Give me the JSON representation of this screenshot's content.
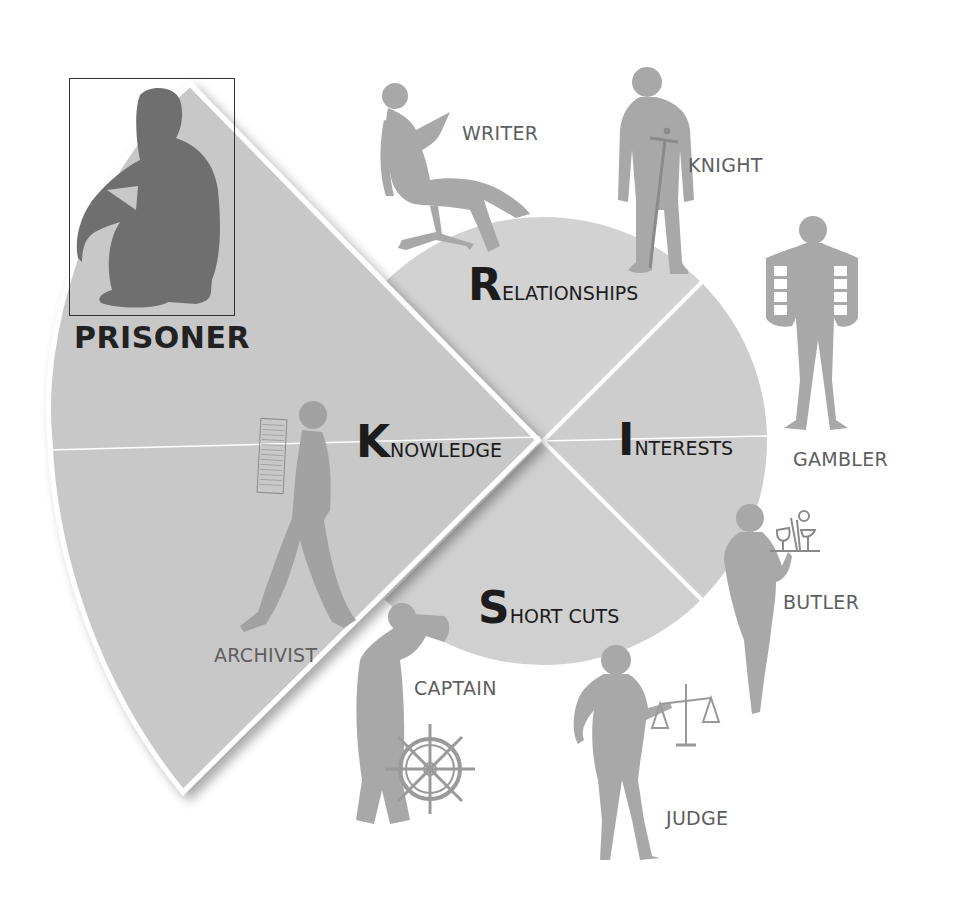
{
  "diagram": {
    "colors": {
      "segment_fill": "#cfcfcf",
      "wedge_fill": "#c9c9c9",
      "figure_fill": "#a9a9a9",
      "prisoner_fill": "#707070",
      "divider": "#ffffff",
      "label_text": "#5e5e5e",
      "segment_text": "#1c1c1c"
    },
    "segments": [
      {
        "id": "relationships",
        "initial": "R",
        "rest": "ELATIONSHIPS"
      },
      {
        "id": "interests",
        "initial": "I",
        "rest": "NTERESTS"
      },
      {
        "id": "short-cuts",
        "initial": "S",
        "rest": "HORT CUTS"
      },
      {
        "id": "knowledge",
        "initial": "K",
        "rest": "NOWLEDGE"
      }
    ],
    "highlight": {
      "label": "PRISONER"
    },
    "characters": [
      {
        "id": "writer",
        "label": "WRITER"
      },
      {
        "id": "knight",
        "label": "KNIGHT"
      },
      {
        "id": "gambler",
        "label": "GAMBLER"
      },
      {
        "id": "butler",
        "label": "BUTLER"
      },
      {
        "id": "judge",
        "label": "JUDGE"
      },
      {
        "id": "captain",
        "label": "CAPTAIN"
      },
      {
        "id": "archivist",
        "label": "ARCHIVIST"
      }
    ]
  }
}
